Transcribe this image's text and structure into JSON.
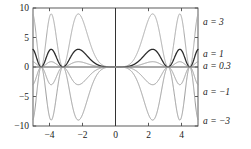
{
  "chart_data": {
    "type": "line",
    "title": "",
    "xlabel": "",
    "ylabel": "",
    "xlim": [
      -5,
      5
    ],
    "ylim": [
      -10,
      10
    ],
    "grid": false,
    "legend_position": "right",
    "xticks": [
      -4,
      -2,
      0,
      2,
      4
    ],
    "xtick_labels": [
      "−4",
      "−2",
      "0",
      "2",
      "4"
    ],
    "yticks": [
      -10,
      -5,
      0,
      5,
      10
    ],
    "ytick_labels": [
      "−10",
      "−5",
      "0",
      "5",
      "10"
    ],
    "series": [
      {
        "name": "a = 3",
        "a": 3,
        "amplitude": 9,
        "color": "#a8a8a8",
        "width": 1.0,
        "label": "a = 3",
        "label_y": 18
      },
      {
        "name": "a = 1",
        "a": 1,
        "amplitude": 3,
        "color": "#2b2b2b",
        "width": 1.3,
        "label": "a = 1",
        "label_y": 50
      },
      {
        "name": "a = 0.3",
        "a": 0.3,
        "amplitude": 0.9,
        "color": "#9a9a9a",
        "width": 1.0,
        "label": "a = 0.3",
        "label_y": 62
      },
      {
        "name": "a = -1",
        "a": -1,
        "amplitude": -3,
        "color": "#9a9a9a",
        "width": 1.0,
        "label": "a = −1",
        "label_y": 88
      },
      {
        "name": "a = -3",
        "a": -3,
        "amplitude": -9,
        "color": "#9a9a9a",
        "width": 1.0,
        "label": "a = −3",
        "label_y": 117
      }
    ],
    "zero_line_color": "#555555",
    "y_axis_line_color": "#333333",
    "frame_color": "#4a4a4a"
  },
  "figure": {
    "background": "#ffffff",
    "plot_left": 33,
    "plot_right": 198,
    "plot_top": 8,
    "plot_bottom": 126
  }
}
